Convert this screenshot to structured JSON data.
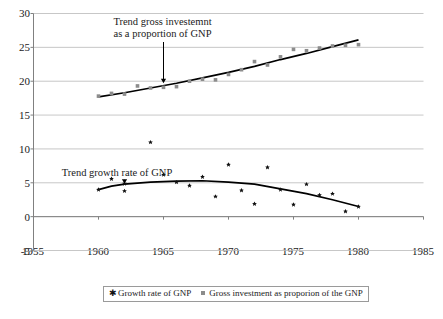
{
  "chart_data": {
    "type": "scatter",
    "title": "",
    "xlabel": "",
    "ylabel": "",
    "xlim": [
      1955,
      1985
    ],
    "ylim": [
      -5,
      30
    ],
    "xticks": [
      1955,
      1960,
      1965,
      1970,
      1975,
      1980,
      1985
    ],
    "yticks": [
      30,
      25,
      20,
      15,
      10,
      5,
      0,
      -5
    ],
    "grid": true,
    "legend_position": "bottom",
    "series": [
      {
        "name": "Growth rate of GNP",
        "marker": "star",
        "color": "#111111",
        "x": [
          1960,
          1961,
          1962,
          1962,
          1964,
          1965,
          1966,
          1967,
          1968,
          1969,
          1970,
          1971,
          1972,
          1973,
          1974,
          1975,
          1976,
          1977,
          1978,
          1979,
          1980
        ],
        "values": [
          4.0,
          5.6,
          4.9,
          3.8,
          11.0,
          6.2,
          5.1,
          4.6,
          5.9,
          3.0,
          7.7,
          3.9,
          1.9,
          7.3,
          4.0,
          1.8,
          4.8,
          3.2,
          3.4,
          0.8,
          1.5
        ]
      },
      {
        "name": "Gross investment as proporion of the GNP",
        "marker": "square",
        "color": "#8c8c8c",
        "x": [
          1960,
          1961,
          1962,
          1963,
          1964,
          1965,
          1966,
          1967,
          1968,
          1969,
          1970,
          1971,
          1972,
          1973,
          1974,
          1975,
          1976,
          1977,
          1978,
          1979,
          1980
        ],
        "values": [
          17.8,
          18.2,
          18.1,
          19.3,
          19.0,
          19.1,
          19.2,
          20.0,
          20.3,
          20.2,
          21.0,
          21.7,
          22.9,
          22.4,
          23.6,
          24.7,
          24.5,
          24.9,
          25.2,
          25.3,
          25.4
        ]
      }
    ],
    "trend_lines": [
      {
        "name": "Trend gross investemnt as a proportion of GNP",
        "color": "#000000",
        "points": [
          [
            1960,
            17.7
          ],
          [
            1962,
            18.3
          ],
          [
            1964,
            19.0
          ],
          [
            1966,
            19.7
          ],
          [
            1968,
            20.5
          ],
          [
            1970,
            21.3
          ],
          [
            1972,
            22.2
          ],
          [
            1974,
            23.2
          ],
          [
            1976,
            24.1
          ],
          [
            1978,
            25.1
          ],
          [
            1980,
            26.1
          ]
        ]
      },
      {
        "name": "Trend growth rate of GNP",
        "color": "#000000",
        "points": [
          [
            1960,
            4.0
          ],
          [
            1961,
            4.5
          ],
          [
            1962,
            4.8
          ],
          [
            1964,
            5.1
          ],
          [
            1966,
            5.25
          ],
          [
            1968,
            5.3
          ],
          [
            1970,
            5.1
          ],
          [
            1972,
            4.8
          ],
          [
            1974,
            4.1
          ],
          [
            1976,
            3.4
          ],
          [
            1978,
            2.5
          ],
          [
            1980,
            1.5
          ]
        ]
      }
    ],
    "annotations": [
      {
        "id": "investment-annotation",
        "line1": "Trend gross investemnt",
        "line2": "as a proportion of GNP",
        "arrow_to": [
          1965,
          19.7
        ]
      },
      {
        "id": "growth-annotation",
        "line1": "Trend growth rate of GNP",
        "line2": "",
        "arrow_to": [
          1962,
          4.85
        ]
      }
    ]
  },
  "axis": {
    "y_labels": [
      "30",
      "25",
      "20",
      "15",
      "10",
      "5",
      "0",
      "-5"
    ],
    "x_labels": [
      "1955",
      "1960",
      "1965",
      "1970",
      "1975",
      "1980",
      "1985"
    ]
  },
  "annotations": {
    "investment": {
      "line1": "Trend gross investemnt",
      "line2": "as a proportion of GNP"
    },
    "growth": {
      "line1": "Trend growth rate of GNP"
    }
  },
  "legend": {
    "items": [
      {
        "label": "Growth rate of GNP",
        "marker": "star-marker",
        "color": "#111111"
      },
      {
        "label": "Gross investment as proporion of the GNP",
        "marker": "square-marker",
        "color": "#8c8c8c"
      }
    ]
  },
  "colors": {
    "series_growth": "#111111",
    "series_investment": "#8c8c8c",
    "trend": "#000000",
    "grid": "#b9b9b9",
    "axis": "#808080",
    "text": "#1a1a1a"
  }
}
